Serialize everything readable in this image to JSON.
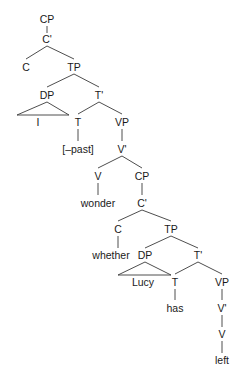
{
  "diagram": {
    "type": "syntax-tree",
    "nodes": [
      {
        "id": "cp1",
        "label": "CP",
        "x": 47,
        "y": 19
      },
      {
        "id": "cbar1",
        "label": "C'",
        "x": 47,
        "y": 39
      },
      {
        "id": "c1",
        "label": "C",
        "x": 26,
        "y": 67
      },
      {
        "id": "tp1",
        "label": "TP",
        "x": 74,
        "y": 67
      },
      {
        "id": "dp1",
        "label": "DP",
        "x": 47,
        "y": 95
      },
      {
        "id": "tbar1",
        "label": "T'",
        "x": 99,
        "y": 95
      },
      {
        "id": "i",
        "label": "I",
        "x": 38,
        "y": 122
      },
      {
        "id": "t1",
        "label": "T",
        "x": 78,
        "y": 122
      },
      {
        "id": "vp1",
        "label": "VP",
        "x": 122,
        "y": 122
      },
      {
        "id": "past",
        "label": "[–past]",
        "x": 78,
        "y": 149
      },
      {
        "id": "vbar1",
        "label": "V'",
        "x": 122,
        "y": 149
      },
      {
        "id": "v1",
        "label": "V",
        "x": 98,
        "y": 176
      },
      {
        "id": "cp2",
        "label": "CP",
        "x": 142,
        "y": 176
      },
      {
        "id": "wonder",
        "label": "wonder",
        "x": 98,
        "y": 203
      },
      {
        "id": "cbar2",
        "label": "C'",
        "x": 142,
        "y": 203
      },
      {
        "id": "c2",
        "label": "C",
        "x": 118,
        "y": 229
      },
      {
        "id": "tp2",
        "label": "TP",
        "x": 171,
        "y": 229
      },
      {
        "id": "whether",
        "label": "whether",
        "x": 111,
        "y": 255
      },
      {
        "id": "dp2",
        "label": "DP",
        "x": 145,
        "y": 255
      },
      {
        "id": "tbar2",
        "label": "T'",
        "x": 198,
        "y": 255
      },
      {
        "id": "lucy",
        "label": "Lucy",
        "x": 143,
        "y": 282
      },
      {
        "id": "t2",
        "label": "T",
        "x": 175,
        "y": 282
      },
      {
        "id": "vp2",
        "label": "VP",
        "x": 222,
        "y": 282
      },
      {
        "id": "has",
        "label": "has",
        "x": 175,
        "y": 308
      },
      {
        "id": "vbar2",
        "label": "V'",
        "x": 222,
        "y": 308
      },
      {
        "id": "v2",
        "label": "V",
        "x": 222,
        "y": 334
      },
      {
        "id": "left",
        "label": "left",
        "x": 222,
        "y": 360
      }
    ],
    "edges": [
      {
        "x1": 47,
        "y1": 26,
        "x2": 47,
        "y2": 33
      },
      {
        "x1": 47,
        "y1": 46,
        "x2": 26,
        "y2": 59
      },
      {
        "x1": 47,
        "y1": 46,
        "x2": 74,
        "y2": 59
      },
      {
        "x1": 74,
        "y1": 74,
        "x2": 47,
        "y2": 87
      },
      {
        "x1": 74,
        "y1": 74,
        "x2": 99,
        "y2": 87
      },
      {
        "x1": 99,
        "y1": 102,
        "x2": 78,
        "y2": 114
      },
      {
        "x1": 99,
        "y1": 102,
        "x2": 122,
        "y2": 114
      },
      {
        "x1": 78,
        "y1": 129,
        "x2": 78,
        "y2": 141
      },
      {
        "x1": 122,
        "y1": 129,
        "x2": 122,
        "y2": 141
      },
      {
        "x1": 122,
        "y1": 156,
        "x2": 98,
        "y2": 168
      },
      {
        "x1": 122,
        "y1": 156,
        "x2": 142,
        "y2": 168
      },
      {
        "x1": 98,
        "y1": 183,
        "x2": 98,
        "y2": 195
      },
      {
        "x1": 142,
        "y1": 183,
        "x2": 142,
        "y2": 195
      },
      {
        "x1": 142,
        "y1": 210,
        "x2": 118,
        "y2": 221
      },
      {
        "x1": 142,
        "y1": 210,
        "x2": 171,
        "y2": 221
      },
      {
        "x1": 118,
        "y1": 236,
        "x2": 118,
        "y2": 248
      },
      {
        "x1": 171,
        "y1": 236,
        "x2": 145,
        "y2": 248
      },
      {
        "x1": 171,
        "y1": 236,
        "x2": 198,
        "y2": 248
      },
      {
        "x1": 198,
        "y1": 262,
        "x2": 175,
        "y2": 274
      },
      {
        "x1": 198,
        "y1": 262,
        "x2": 222,
        "y2": 274
      },
      {
        "x1": 175,
        "y1": 289,
        "x2": 175,
        "y2": 300
      },
      {
        "x1": 222,
        "y1": 289,
        "x2": 222,
        "y2": 300
      },
      {
        "x1": 222,
        "y1": 315,
        "x2": 222,
        "y2": 327
      },
      {
        "x1": 222,
        "y1": 341,
        "x2": 222,
        "y2": 353
      }
    ],
    "triangles": [
      {
        "id": "dp1-triangle",
        "points": "47,102 17,115 69,115"
      },
      {
        "id": "dp2-triangle",
        "points": "145,262 118,275 171,275"
      }
    ]
  }
}
